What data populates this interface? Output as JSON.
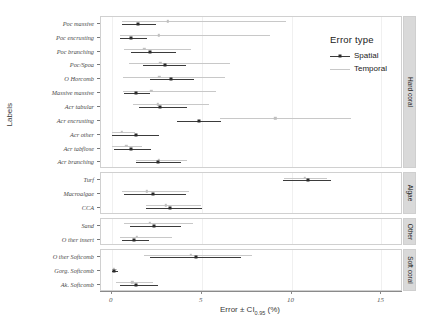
{
  "chart_data": {
    "type": "scatter",
    "title": "",
    "xlabel": "Error ± CI0.95 (%)",
    "xlabel_main": "Error ± CI",
    "xlabel_sub": "0.95",
    "xlabel_tail": " (%)",
    "ylabel": "Labels",
    "xlim": [
      -0.6,
      16.2
    ],
    "xticks": [
      0,
      5,
      10,
      15
    ],
    "xticklabels": [
      "0",
      "5",
      "10",
      "15"
    ],
    "grid": true,
    "legend": {
      "title": "Error type",
      "position": "top-right-inside",
      "entries": [
        {
          "name": "Spatial",
          "color": "#3b3b3b"
        },
        {
          "name": "Temporal",
          "color": "#c8c8c8"
        }
      ]
    },
    "panels": [
      {
        "name": "Hard coral",
        "rows": [
          {
            "label": "Poc massive",
            "spatial": {
              "mean": 1.45,
              "low": 0.55,
              "high": 2.45
            },
            "temporal": {
              "mean": 3.1,
              "low": 0.55,
              "high": 9.7
            }
          },
          {
            "label": "Poc encrusting",
            "spatial": {
              "mean": 1.05,
              "low": 0.45,
              "high": 1.95
            },
            "temporal": {
              "mean": 2.6,
              "low": 0.45,
              "high": 8.8
            }
          },
          {
            "label": "Poc branching",
            "spatial": {
              "mean": 2.1,
              "low": 1.05,
              "high": 3.6
            },
            "temporal": {
              "mean": 1.8,
              "low": 0.7,
              "high": 4.4
            }
          },
          {
            "label": "Poc/Spoa",
            "spatial": {
              "mean": 2.95,
              "low": 1.75,
              "high": 4.15
            },
            "temporal": {
              "mean": 2.7,
              "low": 0.95,
              "high": 6.6
            }
          },
          {
            "label": "O Horcomb",
            "spatial": {
              "mean": 3.3,
              "low": 2.1,
              "high": 4.6
            },
            "temporal": {
              "mean": 2.65,
              "low": 0.6,
              "high": 6.3
            }
          },
          {
            "label": "Massive massive",
            "spatial": {
              "mean": 1.35,
              "low": 0.7,
              "high": 2.15
            },
            "temporal": {
              "mean": 2.2,
              "low": 0.65,
              "high": 5.8
            }
          },
          {
            "label": "Acr tabular",
            "spatial": {
              "mean": 2.7,
              "low": 1.5,
              "high": 4.2
            },
            "temporal": {
              "mean": 2.55,
              "low": 1.2,
              "high": 5.4
            }
          },
          {
            "label": "Acr encrusting",
            "spatial": {
              "mean": 4.85,
              "low": 3.6,
              "high": 6.1
            },
            "temporal": {
              "mean": 9.1,
              "low": 6.0,
              "high": 13.3
            }
          },
          {
            "label": "Acr other",
            "spatial": {
              "mean": 1.35,
              "low": 0.0,
              "high": 2.6
            },
            "temporal": {
              "mean": 0.55,
              "low": 0.0,
              "high": 1.3
            }
          },
          {
            "label": "Acr tabflose",
            "spatial": {
              "mean": 1.05,
              "low": 0.1,
              "high": 2.2
            },
            "temporal": {
              "mean": 0.8,
              "low": 0.0,
              "high": 1.7
            }
          },
          {
            "label": "Acr branching",
            "spatial": {
              "mean": 2.55,
              "low": 1.35,
              "high": 3.85
            },
            "temporal": {
              "mean": 2.6,
              "low": 1.35,
              "high": 4.2
            }
          }
        ]
      },
      {
        "name": "Algae",
        "rows": [
          {
            "label": "Turf",
            "spatial": {
              "mean": 10.9,
              "low": 9.55,
              "high": 12.2
            },
            "temporal": {
              "mean": 10.75,
              "low": 9.6,
              "high": 12.0
            }
          },
          {
            "label": "Macroalgae",
            "spatial": {
              "mean": 2.3,
              "low": 0.7,
              "high": 4.15
            },
            "temporal": {
              "mean": 1.95,
              "low": 0.55,
              "high": 4.3
            }
          },
          {
            "label": "CCA",
            "spatial": {
              "mean": 3.25,
              "low": 1.9,
              "high": 5.0
            },
            "temporal": {
              "mean": 3.0,
              "low": 1.9,
              "high": 4.95
            }
          }
        ]
      },
      {
        "name": "Other",
        "rows": [
          {
            "label": "Sand",
            "spatial": {
              "mean": 2.35,
              "low": 1.0,
              "high": 3.85
            },
            "temporal": {
              "mean": 2.1,
              "low": 0.7,
              "high": 4.5
            }
          },
          {
            "label": "O ther insert",
            "spatial": {
              "mean": 1.25,
              "low": 0.55,
              "high": 2.05
            },
            "temporal": {
              "mean": 1.4,
              "low": 0.45,
              "high": 3.35
            }
          }
        ]
      },
      {
        "name": "Soft coral",
        "rows": [
          {
            "label": "O ther Softcomb",
            "spatial": {
              "mean": 4.7,
              "low": 2.1,
              "high": 7.2
            },
            "temporal": {
              "mean": 4.4,
              "low": 1.8,
              "high": 7.8
            }
          },
          {
            "label": "Gorg. Softcomb",
            "spatial": {
              "mean": 0.1,
              "low": 0.0,
              "high": 0.35
            },
            "temporal": {
              "mean": 0.1,
              "low": 0.0,
              "high": 0.3
            }
          },
          {
            "label": "Ak. Softcomb",
            "spatial": {
              "mean": 1.35,
              "low": 0.45,
              "high": 2.55
            },
            "temporal": {
              "mean": 1.15,
              "low": 0.25,
              "high": 2.3
            }
          }
        ]
      }
    ]
  }
}
